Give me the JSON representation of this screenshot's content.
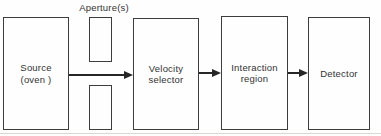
{
  "diagram": {
    "aperture_label": "Aperture(s)",
    "blocks": [
      {
        "id": "source",
        "lines": [
          "Source",
          "(oven )"
        ]
      },
      {
        "id": "velocity",
        "lines": [
          "Velocity",
          "selector"
        ]
      },
      {
        "id": "interaction",
        "lines": [
          "Interaction",
          "region"
        ]
      },
      {
        "id": "detector",
        "lines": [
          "Detector"
        ]
      }
    ],
    "apertures": {
      "count": 2
    },
    "flow": [
      "source",
      "apertures",
      "velocity selector",
      "interaction region",
      "detector"
    ],
    "colors": {
      "box_border": "#3d3d3d",
      "arrow": "#262626",
      "text": "#333333",
      "background": "#fefefe",
      "baseline_rule": "#d9d9d4"
    }
  }
}
